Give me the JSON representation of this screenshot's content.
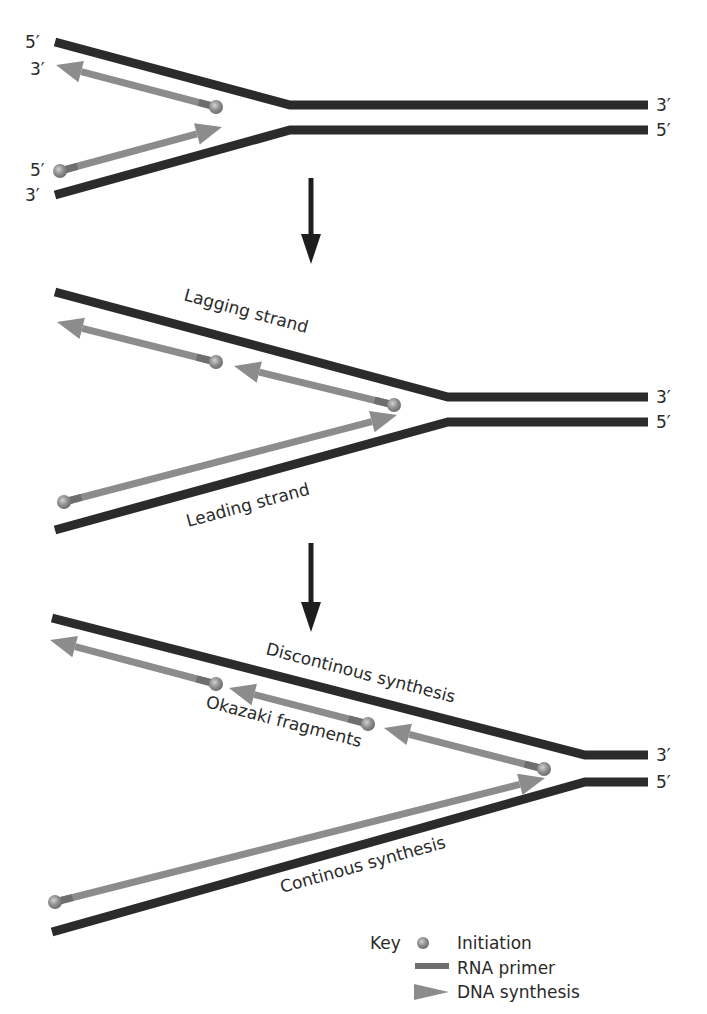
{
  "colors": {
    "strand": "#2b2b2b",
    "synthesis": "#8c8c8c",
    "primer": "#6e6e6e",
    "initiation": "#8a8a8a",
    "initiation_highlight": "#c8c8c8",
    "process_arrow": "#1e1e1e",
    "text": "#2a2a2a"
  },
  "panels": [
    {
      "id": "panel-1-initiation",
      "strands": [
        {
          "name": "top-parental-strand",
          "points": [
            [
              55,
              42
            ],
            [
              290,
              105
            ],
            [
              648,
              105
            ]
          ],
          "left_label": "5′",
          "right_label": "3′"
        },
        {
          "name": "bottom-parental-strand",
          "points": [
            [
              55,
              195
            ],
            [
              290,
              130
            ],
            [
              648,
              130
            ]
          ],
          "left_label": "3′",
          "right_label": "5′"
        }
      ],
      "left_extra_labels": [
        {
          "text": "3′",
          "x": 30,
          "y": 75
        },
        {
          "text": "5′",
          "x": 30,
          "y": 176
        }
      ],
      "new_strands": [
        {
          "name": "lagging-initial",
          "start": [
            216,
            107
          ],
          "end": [
            56,
            65
          ],
          "primer_len": 18
        },
        {
          "name": "leading-initial",
          "start": [
            60,
            171
          ],
          "end": [
            222,
            127
          ],
          "primer_len": 18
        }
      ],
      "labels": []
    },
    {
      "id": "panel-2-elongation",
      "strands": [
        {
          "name": "top-parental-strand",
          "points": [
            [
              55,
              292
            ],
            [
              448,
              397
            ],
            [
              648,
              397
            ]
          ],
          "right_label": "3′"
        },
        {
          "name": "bottom-parental-strand",
          "points": [
            [
              55,
              530
            ],
            [
              448,
              422
            ],
            [
              648,
              422
            ]
          ],
          "right_label": "5′"
        }
      ],
      "new_strands": [
        {
          "name": "lagging-fragment-1",
          "start": [
            216,
            362
          ],
          "end": [
            57,
            322
          ],
          "primer_len": 20
        },
        {
          "name": "lagging-fragment-2",
          "start": [
            394,
            405
          ],
          "end": [
            234,
            366
          ],
          "primer_len": 20
        },
        {
          "name": "leading-strand",
          "start": [
            64,
            502
          ],
          "end": [
            397,
            415
          ],
          "primer_len": 18
        }
      ],
      "labels": [
        {
          "text": "Lagging strand",
          "x": 183,
          "y": 300,
          "angle": 15
        },
        {
          "text": "Leading strand",
          "x": 188,
          "y": 527,
          "angle": -15
        }
      ]
    },
    {
      "id": "panel-3-synthesis",
      "strands": [
        {
          "name": "top-parental-strand",
          "points": [
            [
              52,
              618
            ],
            [
              585,
              755
            ],
            [
              648,
              755
            ]
          ],
          "right_label": "3′"
        },
        {
          "name": "bottom-parental-strand",
          "points": [
            [
              52,
              932
            ],
            [
              585,
              782
            ],
            [
              648,
              782
            ]
          ],
          "right_label": "5′"
        }
      ],
      "new_strands": [
        {
          "name": "okazaki-fragment-1",
          "start": [
            216,
            684
          ],
          "end": [
            50,
            640
          ],
          "primer_len": 20
        },
        {
          "name": "okazaki-fragment-2",
          "start": [
            368,
            724
          ],
          "end": [
            229,
            688
          ],
          "primer_len": 20
        },
        {
          "name": "okazaki-fragment-3",
          "start": [
            544,
            769
          ],
          "end": [
            384,
            728
          ],
          "primer_len": 20
        },
        {
          "name": "continuous-strand",
          "start": [
            55,
            902
          ],
          "end": [
            545,
            778
          ],
          "primer_len": 18
        }
      ],
      "labels": [
        {
          "text": "Discontinous synthesis",
          "x": 265,
          "y": 654,
          "angle": 14.5
        },
        {
          "text": "Okazaki fragments",
          "x": 205,
          "y": 707,
          "angle": 14.5
        },
        {
          "text": "Continous synthesis",
          "x": 282,
          "y": 893,
          "angle": -15.5
        }
      ]
    }
  ],
  "process_arrows": [
    {
      "name": "step-arrow-1",
      "x": 311,
      "y1": 178,
      "y2": 264
    },
    {
      "name": "step-arrow-2",
      "x": 311,
      "y1": 543,
      "y2": 632
    }
  ],
  "key": {
    "title": "Key",
    "items": [
      {
        "symbol": "initiation",
        "label": "Initiation"
      },
      {
        "symbol": "rna-primer",
        "label": "RNA primer"
      },
      {
        "symbol": "dna-synthesis",
        "label": "DNA synthesis"
      }
    ]
  }
}
